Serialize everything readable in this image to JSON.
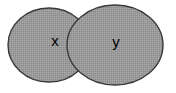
{
  "figure": {
    "kind": "venn-diagram",
    "title": "",
    "background_color": "#ffffff",
    "width": 176,
    "height": 93
  },
  "style": {
    "fill_color": "#9a9a9a",
    "fill_pattern": "dithered-halftone-gray",
    "dither_light": "#a8a8a8",
    "dither_dark": "#8c8c8c",
    "stroke_color": "#3a3a3a",
    "stroke_width": 1.4,
    "label_color": "#000000"
  },
  "sets": [
    {
      "id": "set-x",
      "label": "x",
      "cx": 49,
      "cy": 45,
      "rx": 41,
      "ry": 37,
      "label_x": 55,
      "label_y": 42
    },
    {
      "id": "set-y",
      "label": "y",
      "cx": 115,
      "cy": 45,
      "rx": 48,
      "ry": 40,
      "label_x": 116,
      "label_y": 43
    }
  ],
  "overlap": {
    "present": true,
    "shaded": true,
    "label": ""
  }
}
